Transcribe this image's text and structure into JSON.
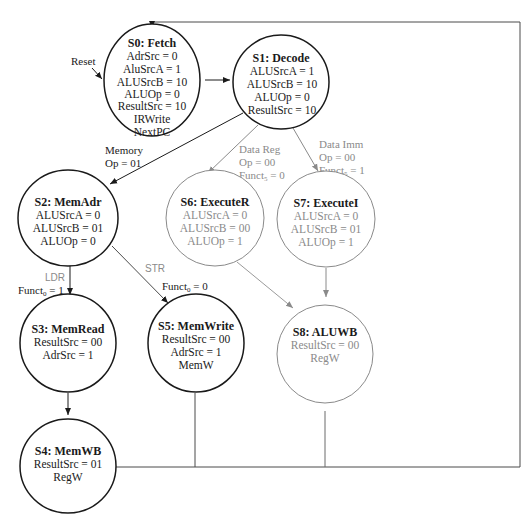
{
  "diagram": {
    "colors": {
      "active": "#1a1a1a",
      "inactive": "#8a8a8a",
      "background": "#ffffff"
    },
    "reset_label": "Reset",
    "states": [
      {
        "id": "S0",
        "title": "S0: Fetch",
        "style": "active",
        "lines": [
          "AdrSrc = 0",
          "AluSrcA = 1",
          "ALUSrcB = 10",
          "ALUOp = 0",
          "ResultSrc = 10",
          "IRWrite",
          "NextPC"
        ]
      },
      {
        "id": "S1",
        "title": "S1: Decode",
        "style": "active",
        "lines": [
          "ALUSrcA = 1",
          "ALUSrcB = 10",
          "ALUOp = 0",
          "ResultSrc = 10"
        ]
      },
      {
        "id": "S2",
        "title": "S2: MemAdr",
        "style": "active",
        "lines": [
          "ALUSrcA = 0",
          "ALUSrcB = 01",
          "ALUOp = 0"
        ]
      },
      {
        "id": "S6",
        "title": "S6: ExecuteR",
        "style": "inactive",
        "lines": [
          "ALUSrcA = 0",
          "ALUSrcB = 00",
          "ALUOp = 1"
        ]
      },
      {
        "id": "S7",
        "title": "S7: ExecuteI",
        "style": "inactive",
        "lines": [
          "ALUSrcA = 0",
          "ALUSrcB = 01",
          "ALUOp = 1"
        ]
      },
      {
        "id": "S3",
        "title": "S3: MemRead",
        "style": "active",
        "lines": [
          "ResultSrc = 00",
          "AdrSrc = 1"
        ]
      },
      {
        "id": "S5",
        "title": "S5: MemWrite",
        "style": "active",
        "lines": [
          "ResultSrc = 00",
          "AdrSrc = 1",
          "MemW"
        ]
      },
      {
        "id": "S8",
        "title": "S8: ALUWB",
        "style": "inactive",
        "lines": [
          "ResultSrc = 00",
          "RegW"
        ]
      },
      {
        "id": "S4",
        "title": "S4: MemWB",
        "style": "active",
        "lines": [
          "ResultSrc = 01",
          "RegW"
        ]
      }
    ],
    "edges": [
      {
        "from": "S0",
        "to": "S1",
        "label": []
      },
      {
        "from": "S1",
        "to": "S2",
        "label": [
          "Memory",
          "Op = 01"
        ]
      },
      {
        "from": "S1",
        "to": "S6",
        "label": [
          "Data Reg",
          "Op = 00",
          "Funct",
          "5",
          " = 0"
        ]
      },
      {
        "from": "S1",
        "to": "S7",
        "label": [
          "Data Imm",
          "Op = 00",
          "Funct",
          "5",
          " = 1"
        ]
      },
      {
        "from": "S2",
        "to": "S3",
        "label": [
          "LDR",
          "Funct",
          "0",
          " = 1"
        ]
      },
      {
        "from": "S2",
        "to": "S5",
        "label": [
          "STR",
          "Funct",
          "0",
          " = 0"
        ]
      },
      {
        "from": "S3",
        "to": "S4",
        "label": []
      },
      {
        "from": "S6",
        "to": "S8",
        "label": []
      },
      {
        "from": "S7",
        "to": "S8",
        "label": []
      },
      {
        "from": "S4",
        "to": "S0",
        "label": []
      },
      {
        "from": "S5",
        "to": "S0",
        "label": []
      },
      {
        "from": "S8",
        "to": "S0",
        "label": []
      }
    ]
  }
}
